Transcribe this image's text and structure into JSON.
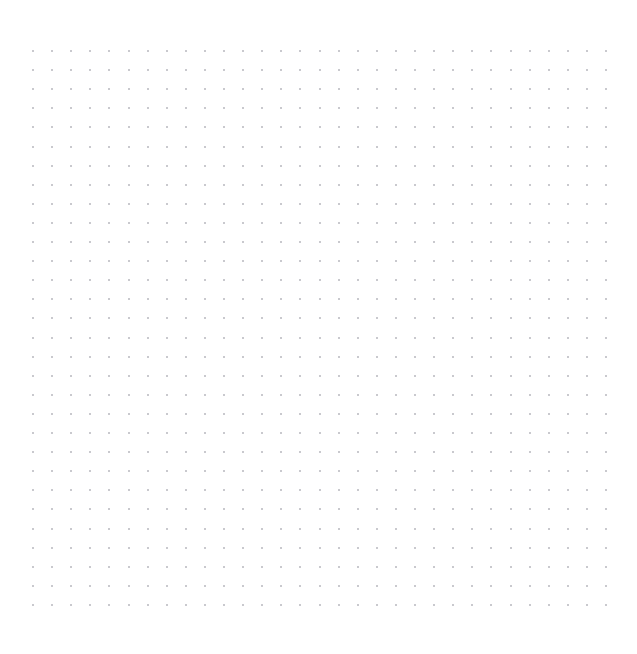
{
  "canvas": {
    "name": "dot-grid-canvas",
    "width": 637,
    "height": 654,
    "background_color": "#ffffff",
    "empty_state_text": ""
  },
  "dot_grid": {
    "icon_name": "dot-grid-pattern",
    "dot_color": "#c9c9ce",
    "dot_size_px": 2,
    "spacing_x_px": 19.1,
    "spacing_y_px": 19.1,
    "origin_x_px": 33,
    "origin_y_px": 51,
    "columns": 31,
    "rows": 30,
    "shape": "square"
  },
  "margins": {
    "left_px": 33,
    "top_px": 51,
    "right_px": 31,
    "bottom_px": 46
  }
}
